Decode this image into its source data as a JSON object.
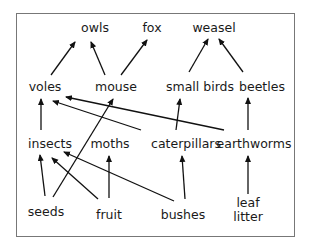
{
  "diagram": {
    "type": "food-web",
    "line_color": "#111111",
    "border_color": "#777777",
    "nodes": {
      "owls": {
        "label": "owls",
        "x": 95,
        "y": 22
      },
      "fox": {
        "label": "fox",
        "x": 152,
        "y": 22
      },
      "weasel": {
        "label": "weasel",
        "x": 213,
        "y": 22
      },
      "voles": {
        "label": "voles",
        "x": 45,
        "y": 81
      },
      "mouse": {
        "label": "mouse",
        "x": 116,
        "y": 81
      },
      "small_birds": {
        "label": "small birds",
        "x": 199,
        "y": 81
      },
      "beetles": {
        "label": "beetles",
        "x": 262,
        "y": 81
      },
      "insects": {
        "label": "insects",
        "x": 50,
        "y": 137
      },
      "moths": {
        "label": "moths",
        "x": 109,
        "y": 137
      },
      "caterpillars": {
        "label": "caterpillars",
        "x": 186,
        "y": 137
      },
      "earthworms": {
        "label": "earthworms",
        "x": 248,
        "y": 137
      },
      "seeds": {
        "label": "seeds",
        "x": 46,
        "y": 206
      },
      "fruit": {
        "label": "fruit",
        "x": 109,
        "y": 208
      },
      "bushes": {
        "label": "bushes",
        "x": 183,
        "y": 208
      },
      "leaf_litter": {
        "label_line1": "leaf",
        "label_line2": "litter",
        "x": 248,
        "y": 196
      }
    },
    "edges": [
      {
        "from": "voles",
        "to": "owls"
      },
      {
        "from": "mouse",
        "to": "owls"
      },
      {
        "from": "mouse",
        "to": "fox"
      },
      {
        "from": "small_birds",
        "to": "weasel"
      },
      {
        "from": "beetles",
        "to": "weasel"
      },
      {
        "from": "insects",
        "to": "voles"
      },
      {
        "from": "caterpillars",
        "to": "voles"
      },
      {
        "from": "earthworms",
        "to": "voles"
      },
      {
        "from": "seeds",
        "to": "mouse"
      },
      {
        "from": "caterpillars",
        "to": "small_birds"
      },
      {
        "from": "earthworms",
        "to": "beetles"
      },
      {
        "from": "seeds",
        "to": "insects"
      },
      {
        "from": "fruit",
        "to": "insects"
      },
      {
        "from": "bushes",
        "to": "insects"
      },
      {
        "from": "fruit",
        "to": "moths"
      },
      {
        "from": "bushes",
        "to": "caterpillars"
      },
      {
        "from": "leaf_litter",
        "to": "earthworms"
      }
    ]
  }
}
